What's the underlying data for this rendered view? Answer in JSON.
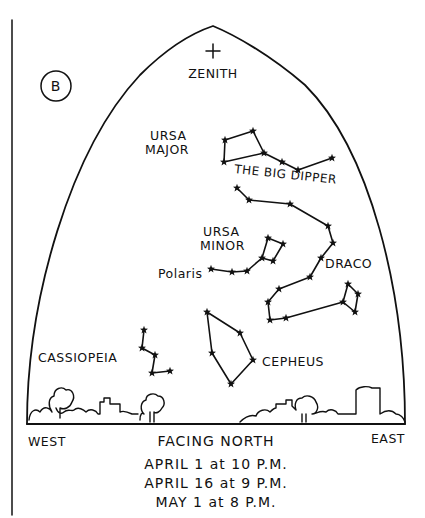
{
  "figure": {
    "badge_letter": "B",
    "zenith_label": "ZENITH",
    "direction_west": "WEST",
    "direction_east": "EAST",
    "facing_label": "FACING NORTH",
    "times": [
      "APRIL 1 at 10 P.M.",
      "APRIL 16 at 9 P.M.",
      "MAY 1 at 8 P.M."
    ]
  },
  "constellations": [
    {
      "id": "ursa-major",
      "label_lines": [
        "URSA",
        "MAJOR"
      ],
      "asterism_label": "THE BIG DIPPER"
    },
    {
      "id": "ursa-minor",
      "label_lines": [
        "URSA",
        "MINOR"
      ],
      "star_label": "Polaris"
    },
    {
      "id": "draco",
      "label_lines": [
        "DRACO"
      ]
    },
    {
      "id": "cepheus",
      "label_lines": [
        "CEPHEUS"
      ]
    },
    {
      "id": "cassiopeia",
      "label_lines": [
        "CASSIOPEIA"
      ]
    }
  ],
  "colors": {
    "ink": "#111111",
    "paper": "#ffffff"
  }
}
